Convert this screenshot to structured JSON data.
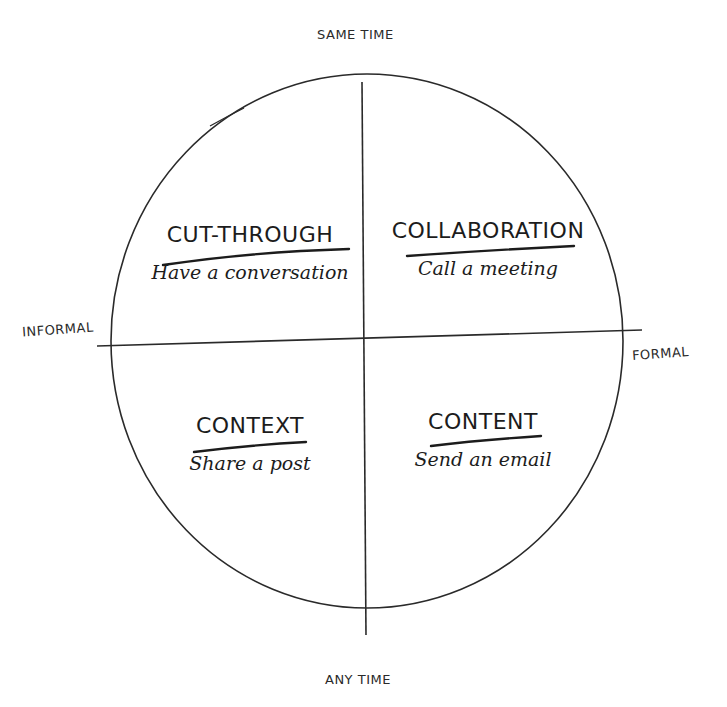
{
  "diagram": {
    "axes": {
      "top": "SAME TIME",
      "bottom": "ANY TIME",
      "left": "INFORMAL",
      "right": "FORMAL"
    },
    "quadrants": [
      {
        "position": "top-left",
        "title": "CUT-THROUGH",
        "subtitle": "Have a conversation"
      },
      {
        "position": "top-right",
        "title": "COLLABORATION",
        "subtitle": "Call a meeting"
      },
      {
        "position": "bottom-left",
        "title": "CONTEXT",
        "subtitle": "Share a post"
      },
      {
        "position": "bottom-right",
        "title": "CONTENT",
        "subtitle": "Send an email"
      }
    ],
    "colors": {
      "ink": "#1c1c1c",
      "background": "#ffffff"
    }
  }
}
